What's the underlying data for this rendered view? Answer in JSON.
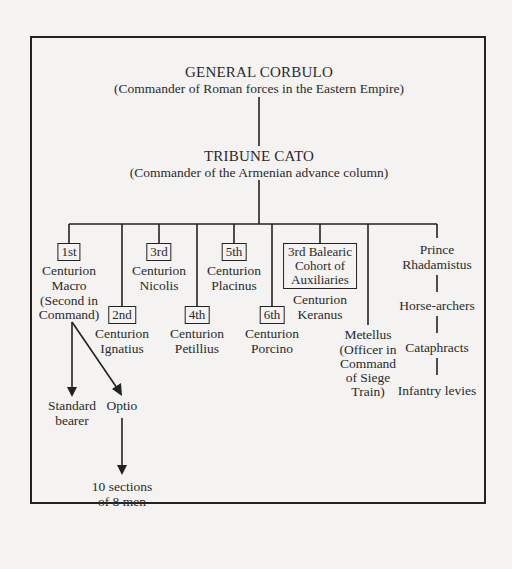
{
  "top": {
    "title": "GENERAL CORBULO",
    "subtitle": "(Commander of Roman forces in the Eastern Empire)"
  },
  "second": {
    "title": "TRIBUNE CATO",
    "subtitle": "(Commander of the Armenian advance column)"
  },
  "centuries": [
    {
      "rank": "1st",
      "line1": "Centurion",
      "line2": "Macro",
      "line3": "(Second in",
      "line4": "Command)"
    },
    {
      "rank": "2nd",
      "line1": "Centurion",
      "line2": "Ignatius"
    },
    {
      "rank": "3rd",
      "line1": "Centurion",
      "line2": "Nicolis"
    },
    {
      "rank": "4th",
      "line1": "Centurion",
      "line2": "Petillius"
    },
    {
      "rank": "5th",
      "line1": "Centurion",
      "line2": "Placinus"
    },
    {
      "rank": "6th",
      "line1": "Centurion",
      "line2": "Porcino"
    }
  ],
  "auxiliaries": {
    "box_line1": "3rd Balearic",
    "box_line2": "Cohort of",
    "box_line3": "Auxiliaries",
    "line1": "Centurion",
    "line2": "Keranus"
  },
  "metellus": {
    "name": "Metellus",
    "line1": "(Officer in",
    "line2": "Command",
    "line3": "of Siege",
    "line4": "Train)"
  },
  "prince": {
    "line1": "Prince",
    "line2": "Rhadamistus",
    "units": [
      "Horse-archers",
      "Cataphracts",
      "Infantry levies"
    ]
  },
  "macro_subordinates": {
    "standard_bearer_1": "Standard",
    "standard_bearer_2": "bearer",
    "optio": "Optio",
    "sections_1": "10 sections",
    "sections_2": "of 8 men"
  }
}
